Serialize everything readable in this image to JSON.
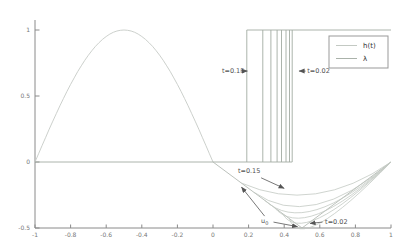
{
  "figure": {
    "background": "#ffffff",
    "axis_color": "#8a8a8a",
    "annotation_color": "#4f4f4f"
  },
  "chart_data": {
    "type": "line",
    "title": "",
    "xlabel": "",
    "ylabel": "",
    "xlim": [
      -1,
      1
    ],
    "ylim": [
      -0.5,
      1.08
    ],
    "grid": false,
    "x_ticks": [
      {
        "value": -1,
        "label": "-1"
      },
      {
        "value": -0.8,
        "label": "-0.8"
      },
      {
        "value": -0.6,
        "label": "-0.6"
      },
      {
        "value": -0.4,
        "label": "-0.4"
      },
      {
        "value": -0.2,
        "label": "-0.2"
      },
      {
        "value": 0,
        "label": "0"
      },
      {
        "value": 0.2,
        "label": "0.2"
      },
      {
        "value": 0.4,
        "label": "0.4"
      },
      {
        "value": 0.6,
        "label": "0.6"
      },
      {
        "value": 0.8,
        "label": "0.8"
      },
      {
        "value": 1,
        "label": "1"
      }
    ],
    "y_ticks": [
      {
        "value": -0.5,
        "label": "-0.5"
      },
      {
        "value": 0,
        "label": "0"
      },
      {
        "value": 0.5,
        "label": "0.5"
      },
      {
        "value": 1,
        "label": "1"
      }
    ],
    "legend": {
      "position": "upper-right",
      "entries": [
        {
          "label": "h(t)",
          "color": "#c3c9c3"
        },
        {
          "label": "λ",
          "color": "#aab2aa"
        }
      ]
    },
    "series": {
      "lambda": {
        "name": "lambda",
        "shape": "sine-hump",
        "x_range": [
          -1,
          0
        ],
        "peak": [
          -0.5,
          1
        ],
        "endpoints": [
          [
            -1,
            0
          ],
          [
            0,
            0
          ]
        ],
        "color": "#c6cbc6"
      },
      "h_steps": {
        "name": "h(t) step family",
        "low_level": 0,
        "high_level": 1,
        "low_from_x": -1,
        "high_to_x": 1,
        "jump_x": [
          0.19,
          0.28,
          0.325,
          0.36,
          0.385,
          0.41,
          0.43,
          0.445
        ],
        "color": "#a3aba3"
      },
      "u0": {
        "name": "u0 initial condition",
        "points": [
          [
            0,
            0
          ],
          [
            0.5,
            -0.5
          ],
          [
            1,
            0
          ]
        ],
        "color": "#b3bab3"
      },
      "u_curves": [
        {
          "start": [
            0.16,
            -0.16
          ],
          "ctrl": [
            0.573,
            -0.402
          ],
          "end": [
            1,
            0
          ]
        },
        {
          "start": [
            0.229,
            -0.229
          ],
          "ctrl": [
            0.545,
            -0.53
          ],
          "end": [
            1,
            0
          ]
        },
        {
          "start": [
            0.291,
            -0.291
          ],
          "ctrl": [
            0.522,
            -0.576
          ],
          "end": [
            1,
            0
          ]
        },
        {
          "start": [
            0.343,
            -0.343
          ],
          "ctrl": [
            0.511,
            -0.614
          ],
          "end": [
            1,
            0
          ]
        },
        {
          "start": [
            0.389,
            -0.389
          ],
          "ctrl": [
            0.5,
            -0.652
          ],
          "end": [
            1,
            0
          ]
        },
        {
          "start": [
            0.429,
            -0.429
          ],
          "ctrl": [
            0.494,
            -0.705
          ],
          "end": [
            1,
            0
          ]
        }
      ],
      "u_curves_color": "#c3c9c3"
    },
    "annotations": [
      {
        "id": "t-015-top",
        "text": "t=0.15",
        "pos": [
          0.05,
          0.689
        ],
        "anchor": "start",
        "arrows": [
          [
            0.155,
            0.689,
            0.193,
            0.689
          ]
        ]
      },
      {
        "id": "t-002-top",
        "text": "t=0.02",
        "pos": [
          0.53,
          0.689
        ],
        "anchor": "start",
        "arrows": [
          [
            0.52,
            0.689,
            0.483,
            0.689
          ]
        ]
      },
      {
        "id": "t-015-bottom",
        "text": "t=0.15",
        "pos": [
          0.14,
          -0.07
        ],
        "anchor": "start",
        "arrows": [
          [
            0.27,
            -0.12,
            0.4,
            -0.2
          ]
        ]
      },
      {
        "id": "u0",
        "text": "u",
        "sub": "0",
        "pos": [
          0.27,
          -0.45
        ],
        "anchor": "start",
        "arrows": [
          [
            0.34,
            -0.455,
            0.475,
            -0.49
          ],
          [
            0.29,
            -0.41,
            0.16,
            -0.19
          ]
        ]
      },
      {
        "id": "t-002-bottom",
        "text": "t=0.02",
        "pos": [
          0.63,
          -0.455
        ],
        "anchor": "start",
        "arrows": [
          [
            0.615,
            -0.455,
            0.545,
            -0.465
          ]
        ]
      }
    ]
  }
}
